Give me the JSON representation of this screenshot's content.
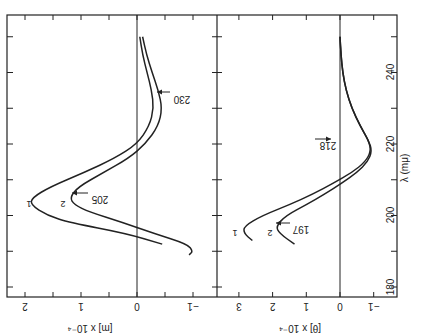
{
  "figure": {
    "orientation": "rotated 90 degrees (wavelength axis runs vertically at right, printed upside-down)",
    "ink_color": "#222222",
    "background": "#ffffff"
  },
  "chart_data": [
    {
      "type": "line",
      "title": "Optical rotatory dispersion",
      "xlabel": "λ (mμ)",
      "ylabel": "[m] x 10⁻⁴",
      "xlim": [
        177,
        256
      ],
      "ylim": [
        -1.2,
        2.2
      ],
      "x_ticks": [
        180,
        200,
        220,
        240
      ],
      "y_ticks": [
        -1,
        0,
        1,
        2
      ],
      "y_tick_labels": [
        "−1",
        "0",
        "1",
        "2"
      ],
      "grid": false,
      "zero_line": true,
      "series": [
        {
          "name": "1",
          "x": [
            192,
            195,
            198,
            200,
            203,
            205,
            208,
            212,
            216,
            220,
            225,
            230,
            235,
            240,
            245,
            250
          ],
          "y": [
            -0.45,
            0.2,
            1.2,
            1.6,
            1.9,
            1.87,
            1.55,
            0.95,
            0.4,
            0.0,
            -0.22,
            -0.3,
            -0.26,
            -0.18,
            -0.1,
            -0.05
          ]
        },
        {
          "name": "2",
          "x": [
            189,
            190,
            192,
            195,
            198,
            201,
            203,
            205,
            208,
            212,
            216,
            220,
            225,
            230,
            235,
            240,
            245,
            250
          ],
          "y": [
            -0.93,
            -1.0,
            -0.9,
            -0.3,
            0.25,
            0.85,
            1.12,
            1.2,
            1.05,
            0.6,
            0.15,
            -0.15,
            -0.38,
            -0.45,
            -0.38,
            -0.27,
            -0.17,
            -0.1
          ]
        }
      ],
      "annotations": [
        {
          "text": "205",
          "x": 205,
          "target_series": "2",
          "arrow": true
        },
        {
          "text": "230",
          "x": 230,
          "target_series": "2",
          "arrow": true
        },
        {
          "text": "1",
          "x": 205,
          "label_for": "series 1"
        },
        {
          "text": "2",
          "x": 205,
          "label_for": "series 2"
        }
      ]
    },
    {
      "type": "line",
      "title": "Circular dichroism",
      "xlabel": "λ (mμ)",
      "ylabel": "[θ] x 10⁻⁴",
      "xlim": [
        177,
        256
      ],
      "ylim": [
        -1.5,
        3.5
      ],
      "x_ticks": [
        180,
        200,
        220,
        240
      ],
      "y_ticks": [
        -1,
        0,
        1,
        2,
        3
      ],
      "y_tick_labels": [
        "−1",
        "0",
        "1",
        "2",
        "3"
      ],
      "grid": false,
      "zero_line": true,
      "series": [
        {
          "name": "1",
          "x": [
            193,
            195,
            197,
            200,
            203,
            206,
            209,
            212,
            215,
            218,
            221,
            225,
            230,
            235,
            240,
            245,
            250
          ],
          "y": [
            2.6,
            2.85,
            2.85,
            2.3,
            1.5,
            0.8,
            0.2,
            -0.35,
            -0.75,
            -0.92,
            -0.85,
            -0.6,
            -0.35,
            -0.18,
            -0.08,
            -0.03,
            0.0
          ]
        },
        {
          "name": "2",
          "x": [
            192,
            195,
            197,
            200,
            203,
            206,
            209,
            212,
            215,
            218,
            221,
            225,
            230,
            235,
            240,
            245,
            250
          ],
          "y": [
            1.35,
            1.8,
            1.9,
            1.6,
            1.0,
            0.45,
            -0.05,
            -0.5,
            -0.82,
            -0.95,
            -0.85,
            -0.6,
            -0.35,
            -0.18,
            -0.08,
            -0.03,
            0.0
          ]
        }
      ],
      "annotations": [
        {
          "text": "197",
          "x": 197,
          "target_series": "2",
          "arrow": true
        },
        {
          "text": "218",
          "x": 218,
          "target_series": "1",
          "arrow": true
        },
        {
          "text": "1",
          "x": 197,
          "label_for": "series 1"
        },
        {
          "text": "2",
          "x": 197,
          "label_for": "series 2"
        }
      ]
    }
  ],
  "labels": {
    "x_axis": "λ (mμ)",
    "x_tick_180": "180",
    "x_tick_200": "200",
    "x_tick_220": "220",
    "x_tick_240": "240",
    "top_ylabel": "[m] x 10⁻⁴",
    "bottom_ylabel": "[θ] x 10⁻⁴",
    "top_ann_205": "205",
    "top_ann_230": "230",
    "bottom_ann_197": "197",
    "bottom_ann_218": "218",
    "curve1": "1",
    "curve2": "2"
  }
}
